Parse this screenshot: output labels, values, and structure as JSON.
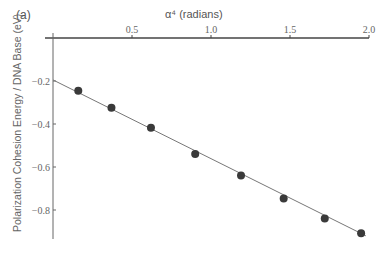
{
  "chart_data": {
    "type": "scatter",
    "panel_label": "(a)",
    "title": "",
    "xlabel": "α⁴ (radians)",
    "ylabel": "Polarization Cohesion Energy / DNA Base (eV)",
    "xlim": [
      0,
      2.0
    ],
    "ylim": [
      -0.92,
      0
    ],
    "x_ticks": [
      "0.5",
      "1.0",
      "1.5",
      "2.0"
    ],
    "y_ticks": [
      "-0.2",
      "-0.4",
      "-0.6",
      "-0.8"
    ],
    "x_axis_position": "top",
    "grid": false,
    "series": [
      {
        "name": "data",
        "type": "scatter",
        "x": [
          0.16,
          0.37,
          0.62,
          0.9,
          1.19,
          1.46,
          1.72,
          1.95
        ],
        "y": [
          -0.245,
          -0.324,
          -0.417,
          -0.54,
          -0.639,
          -0.747,
          -0.839,
          -0.908
        ]
      },
      {
        "name": "linear fit",
        "type": "line",
        "x": [
          0,
          1.98
        ],
        "y": [
          -0.195,
          -0.92
        ]
      }
    ]
  }
}
